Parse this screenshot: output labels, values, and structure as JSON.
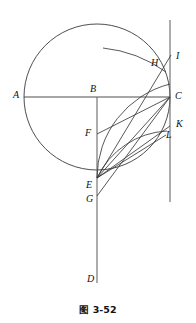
{
  "figure": {
    "caption": "图 3-52",
    "caption_x": 0,
    "caption_y": 302,
    "stroke_color": "#3a3a3a",
    "background": "#ffffff",
    "width": 196,
    "height": 323,
    "circle": {
      "cx": 97,
      "cy": 97,
      "r": 73
    },
    "points": [
      {
        "id": "A",
        "label": "A",
        "x": 24,
        "y": 97,
        "label_x": 13,
        "label_y": 92
      },
      {
        "id": "B",
        "label": "B",
        "x": 97,
        "y": 97,
        "label_x": 90,
        "label_y": 85
      },
      {
        "id": "C",
        "label": "C",
        "x": 170,
        "y": 97,
        "label_x": 175,
        "label_y": 92
      },
      {
        "id": "D",
        "label": "D",
        "x": 97,
        "y": 281,
        "label_x": 88,
        "label_y": 276
      },
      {
        "id": "E",
        "label": "E",
        "x": 97,
        "y": 178,
        "label_x": 88,
        "label_y": 182
      },
      {
        "id": "F",
        "label": "F",
        "x": 97,
        "y": 134,
        "label_x": 87,
        "label_y": 130
      },
      {
        "id": "G",
        "label": "G",
        "x": 97,
        "y": 196,
        "label_x": 88,
        "label_y": 197
      },
      {
        "id": "H",
        "label": "H",
        "x": 162,
        "y": 65,
        "label_x": 152,
        "label_y": 60
      },
      {
        "id": "I",
        "label": "I",
        "x": 170,
        "y": 56,
        "label_x": 176,
        "label_y": 52
      },
      {
        "id": "K",
        "label": "K",
        "x": 170,
        "y": 126,
        "label_x": 176,
        "label_y": 121
      },
      {
        "id": "L",
        "label": "L",
        "x": 165,
        "y": 136,
        "label_x": 166,
        "label_y": 133
      }
    ],
    "segments": [
      {
        "id": "diameter-AC",
        "x1": 24,
        "y1": 97,
        "x2": 170,
        "y2": 97
      },
      {
        "id": "vertical-BD",
        "x1": 97,
        "y1": 97,
        "x2": 97,
        "y2": 283
      },
      {
        "id": "tangent-at-C",
        "x1": 170,
        "y1": 20,
        "x2": 170,
        "y2": 202
      },
      {
        "id": "segment-FC",
        "x1": 97,
        "y1": 134,
        "x2": 170,
        "y2": 97
      },
      {
        "id": "segment-EC",
        "x1": 97,
        "y1": 178,
        "x2": 170,
        "y2": 97
      },
      {
        "id": "segment-EK",
        "x1": 97,
        "y1": 178,
        "x2": 170,
        "y2": 126
      },
      {
        "id": "segment-EL",
        "x1": 97,
        "y1": 178,
        "x2": 165,
        "y2": 136
      },
      {
        "id": "segment-EI",
        "x1": 97,
        "y1": 178,
        "x2": 170,
        "y2": 56
      },
      {
        "id": "segment-GC",
        "x1": 97,
        "y1": 196,
        "x2": 170,
        "y2": 97
      },
      {
        "id": "chord-EC-arc",
        "x1": 97,
        "y1": 178,
        "x2": 170,
        "y2": 97
      }
    ],
    "arcs": [
      {
        "id": "arc-E-to-H",
        "cx": 97,
        "cy": 178,
        "r": 130,
        "path": "M 97 48 A 130 130 0 0 1 164 68"
      },
      {
        "id": "arc-E-to-L",
        "cx": 97,
        "cy": 178,
        "r": 75,
        "path": "M 170 155 A 75 75 0 0 0 141 112"
      }
    ]
  }
}
